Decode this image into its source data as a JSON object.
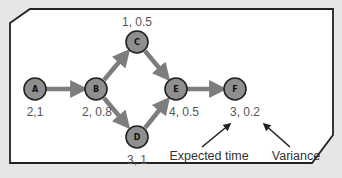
{
  "diagram": {
    "type": "activity-on-node network",
    "colors": {
      "background": "#e6e6e6",
      "frame_fill": "#ffffff",
      "frame_stroke": "#222222",
      "node_fill": "#8f8f8f",
      "edge": "#7d7d7d",
      "value_text": "#555555"
    },
    "nodes": [
      {
        "id": "A",
        "label": "A",
        "value": "2,1",
        "cx": 35,
        "cy": 89,
        "lx": 35,
        "ly": 116
      },
      {
        "id": "B",
        "label": "B",
        "value": "2, 0.8",
        "cx": 96,
        "cy": 89,
        "lx": 97,
        "ly": 116
      },
      {
        "id": "C",
        "label": "C",
        "value": "1, 0.5",
        "cx": 137,
        "cy": 42,
        "lx": 137,
        "ly": 26
      },
      {
        "id": "D",
        "label": "D",
        "value": "3, 1",
        "cx": 137,
        "cy": 137,
        "lx": 137,
        "ly": 164
      },
      {
        "id": "E",
        "label": "E",
        "value": "4, 0.5",
        "cx": 176,
        "cy": 89,
        "lx": 184,
        "ly": 116
      },
      {
        "id": "F",
        "label": "F",
        "value": "3, 0.2",
        "cx": 235,
        "cy": 89,
        "lx": 245,
        "ly": 116
      }
    ],
    "edges": [
      {
        "from": "A",
        "to": "B"
      },
      {
        "from": "B",
        "to": "C"
      },
      {
        "from": "B",
        "to": "D"
      },
      {
        "from": "C",
        "to": "E"
      },
      {
        "from": "D",
        "to": "E"
      },
      {
        "from": "E",
        "to": "F"
      }
    ],
    "annotations": [
      {
        "id": "expected-time",
        "text": "Expected time",
        "x": 209,
        "y": 160
      },
      {
        "id": "variance",
        "text": "Variance",
        "x": 296,
        "y": 160
      }
    ]
  }
}
